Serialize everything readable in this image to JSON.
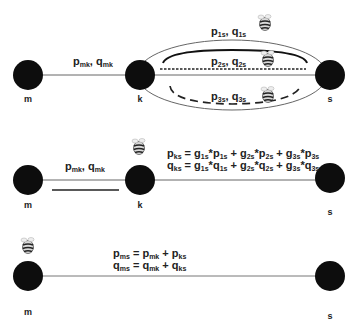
{
  "colors": {
    "node": "#0d0d0d",
    "line": "#555555",
    "text": "#222222",
    "background": "#ffffff"
  },
  "panels": [
    {
      "id": "panel-1",
      "nodes": [
        {
          "label": "m"
        },
        {
          "label": "k"
        },
        {
          "label": "s"
        }
      ],
      "edge_mk_label": {
        "p": "p",
        "p_sub": "mk",
        "sep": ", ",
        "q": "q",
        "q_sub": "mk"
      },
      "paths": [
        {
          "name": "path-1",
          "style": "solid-thick",
          "p": "p",
          "p_sub": "1s",
          "q": "q",
          "q_sub": "1s"
        },
        {
          "name": "path-2",
          "style": "dotted",
          "p": "p",
          "p_sub": "2s",
          "q": "q",
          "q_sub": "2s"
        },
        {
          "name": "path-3",
          "style": "dashed",
          "p": "p",
          "p_sub": "3s",
          "q": "q",
          "q_sub": "3s"
        }
      ],
      "icons": [
        "bee-icon",
        "bee-icon",
        "bee-icon"
      ]
    },
    {
      "id": "panel-2",
      "nodes": [
        {
          "label": "m"
        },
        {
          "label": "k"
        },
        {
          "label": "s"
        }
      ],
      "edge_mk_label": {
        "p": "p",
        "p_sub": "mk",
        "sep": ", ",
        "q": "q",
        "q_sub": "mk"
      },
      "equations": {
        "line1": {
          "lhs": "p",
          "lhs_sub": "ks",
          "terms": [
            {
              "g": "g",
              "g_sub": "1s",
              "v": "p",
              "v_sub": "1s"
            },
            {
              "g": "g",
              "g_sub": "2s",
              "v": "p",
              "v_sub": "2s"
            },
            {
              "g": "g",
              "g_sub": "3s",
              "v": "p",
              "v_sub": "3s"
            }
          ]
        },
        "line2": {
          "lhs": "q",
          "lhs_sub": "ks",
          "terms": [
            {
              "g": "g",
              "g_sub": "1s",
              "v": "q",
              "v_sub": "1s"
            },
            {
              "g": "g",
              "g_sub": "2s",
              "v": "q",
              "v_sub": "2s"
            },
            {
              "g": "g",
              "g_sub": "3s",
              "v": "q",
              "v_sub": "3s"
            }
          ]
        }
      },
      "icons": [
        "bee-icon"
      ]
    },
    {
      "id": "panel-3",
      "nodes": [
        {
          "label": "m"
        },
        {
          "label": "s"
        }
      ],
      "equations": {
        "line1": {
          "lhs": "p",
          "lhs_sub": "ms",
          "a": "p",
          "a_sub": "mk",
          "b": "p",
          "b_sub": "ks"
        },
        "line2": {
          "lhs": "q",
          "lhs_sub": "ms",
          "a": "q",
          "a_sub": "mk",
          "b": "q",
          "b_sub": "ks"
        }
      },
      "icons": [
        "bee-icon"
      ]
    }
  ],
  "symbols": {
    "eq": " = ",
    "plus": " + ",
    "star": "*"
  }
}
